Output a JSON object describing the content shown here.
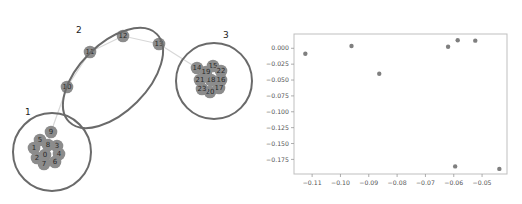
{
  "graph": {
    "clusters": [
      {
        "label": "1",
        "cx": 52,
        "cy": 152,
        "rx": 39,
        "ry": 39,
        "rot": 0,
        "label_x": 25,
        "label_y": 115
      },
      {
        "label": "2",
        "cx": 113,
        "cy": 78,
        "rx": 62,
        "ry": 34,
        "rot": -45,
        "label_x": 76,
        "label_y": 33
      },
      {
        "label": "3",
        "cx": 214,
        "cy": 81,
        "rx": 38,
        "ry": 38,
        "rot": 0,
        "label_x": 223,
        "label_y": 38
      }
    ],
    "nodes": [
      {
        "id": "0",
        "x": 45,
        "y": 155
      },
      {
        "id": "1",
        "x": 34,
        "y": 148
      },
      {
        "id": "2",
        "x": 37,
        "y": 158
      },
      {
        "id": "3",
        "x": 57,
        "y": 146
      },
      {
        "id": "4",
        "x": 59,
        "y": 154
      },
      {
        "id": "5",
        "x": 40,
        "y": 140
      },
      {
        "id": "6",
        "x": 55,
        "y": 162
      },
      {
        "id": "7",
        "x": 44,
        "y": 164
      },
      {
        "id": "8",
        "x": 48,
        "y": 145
      },
      {
        "id": "9",
        "x": 51,
        "y": 132
      },
      {
        "id": "10",
        "x": 67,
        "y": 87
      },
      {
        "id": "11",
        "x": 90,
        "y": 52
      },
      {
        "id": "12",
        "x": 123,
        "y": 36
      },
      {
        "id": "13",
        "x": 159,
        "y": 44
      },
      {
        "id": "14",
        "x": 197,
        "y": 68
      },
      {
        "id": "15",
        "x": 213,
        "y": 66
      },
      {
        "id": "16",
        "x": 221,
        "y": 80
      },
      {
        "id": "17",
        "x": 219,
        "y": 88
      },
      {
        "id": "18",
        "x": 211,
        "y": 80
      },
      {
        "id": "19",
        "x": 206,
        "y": 72
      },
      {
        "id": "20",
        "x": 210,
        "y": 92
      },
      {
        "id": "21",
        "x": 200,
        "y": 80
      },
      {
        "id": "22",
        "x": 221,
        "y": 71
      },
      {
        "id": "23",
        "x": 202,
        "y": 89
      }
    ],
    "edges": [
      [
        "9",
        "10"
      ],
      [
        "10",
        "11"
      ],
      [
        "11",
        "12"
      ],
      [
        "12",
        "13"
      ],
      [
        "13",
        "14"
      ],
      [
        "9",
        "8"
      ],
      [
        "8",
        "0"
      ]
    ]
  },
  "chart_data": {
    "type": "scatter",
    "title": "",
    "xlabel": "",
    "ylabel": "",
    "x": [
      -0.1124,
      -0.0961,
      -0.0863,
      -0.062,
      -0.0586,
      -0.0524,
      -0.0595,
      -0.0439
    ],
    "y": [
      -0.0085,
      0.0036,
      -0.04,
      0.0025,
      0.0126,
      0.012,
      -0.186,
      -0.19
    ],
    "xticks": [
      -0.11,
      -0.1,
      -0.09,
      -0.08,
      -0.07,
      -0.06,
      -0.05
    ],
    "xtick_labels": [
      "−0.11",
      "−0.10",
      "−0.09",
      "−0.08",
      "−0.07",
      "−0.06",
      "−0.05"
    ],
    "yticks": [
      0.0,
      -0.025,
      -0.05,
      -0.075,
      -0.1,
      -0.125,
      -0.15,
      -0.175
    ],
    "ytick_labels": [
      "0.000",
      "−0.025",
      "−0.050",
      "−0.075",
      "−0.100",
      "−0.125",
      "−0.150",
      "−0.175"
    ],
    "xlim": [
      -0.1164,
      -0.0412
    ],
    "ylim": [
      -0.198,
      0.0225
    ],
    "grid": false,
    "legend": null,
    "marker_color": "#7f7f7f"
  }
}
